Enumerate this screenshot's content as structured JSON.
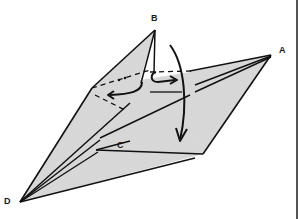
{
  "diagram": {
    "type": "origami-fold-step",
    "paper_color": "#d9d9d9",
    "line_color": "#111111",
    "labels": [
      {
        "id": "B",
        "text": "B",
        "x": 151,
        "y": 14
      },
      {
        "id": "A",
        "text": "A",
        "x": 279,
        "y": 46
      },
      {
        "id": "C",
        "text": "C",
        "x": 117,
        "y": 141
      },
      {
        "id": "D",
        "text": "D",
        "x": 4,
        "y": 197
      }
    ],
    "annotations": {
      "crimp_dots": "••",
      "arrows": [
        "swivel-left-arrow",
        "rotate-loop-arrow",
        "fold-down-arrow"
      ]
    }
  }
}
